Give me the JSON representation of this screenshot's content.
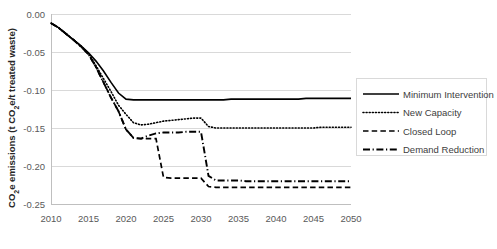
{
  "chart_data": {
    "type": "line",
    "title": "",
    "xlabel": "",
    "ylabel": "CO₂e emissions (t CO₂e/t treated waste)",
    "ylabel_parts": {
      "pre": "CO",
      "sub1": "2",
      "mid": "e emissions (t CO",
      "sub2": "2",
      "post": "e/t treated waste)"
    },
    "xlim": [
      2010,
      2050
    ],
    "ylim": [
      -0.25,
      0.0
    ],
    "grid": true,
    "legend_position": "right",
    "xticks": [
      "2010",
      "2015",
      "2020",
      "2025",
      "2030",
      "2035",
      "2040",
      "2045",
      "2050"
    ],
    "xtick_values": [
      2010,
      2015,
      2020,
      2025,
      2030,
      2035,
      2040,
      2045,
      2050
    ],
    "yticks": [
      "0.00",
      "-0.05",
      "-0.10",
      "-0.15",
      "-0.20",
      "-0.25"
    ],
    "ytick_values": [
      0.0,
      -0.05,
      -0.1,
      -0.15,
      -0.2,
      -0.25
    ],
    "x": [
      2010,
      2011,
      2012,
      2013,
      2014,
      2015,
      2016,
      2017,
      2018,
      2019,
      2020,
      2021,
      2022,
      2023,
      2024,
      2025,
      2026,
      2027,
      2028,
      2029,
      2030,
      2031,
      2032,
      2033,
      2034,
      2035,
      2036,
      2037,
      2038,
      2039,
      2040,
      2041,
      2042,
      2043,
      2044,
      2045,
      2046,
      2047,
      2048,
      2049,
      2050
    ],
    "series": [
      {
        "name": "Minimum Intervention",
        "style": "solid",
        "values": [
          -0.012,
          -0.018,
          -0.026,
          -0.034,
          -0.042,
          -0.051,
          -0.062,
          -0.075,
          -0.09,
          -0.104,
          -0.112,
          -0.113,
          -0.113,
          -0.113,
          -0.113,
          -0.113,
          -0.113,
          -0.113,
          -0.113,
          -0.113,
          -0.113,
          -0.113,
          -0.113,
          -0.113,
          -0.112,
          -0.112,
          -0.112,
          -0.112,
          -0.112,
          -0.112,
          -0.112,
          -0.112,
          -0.112,
          -0.112,
          -0.111,
          -0.111,
          -0.111,
          -0.111,
          -0.111,
          -0.111,
          -0.111
        ]
      },
      {
        "name": "New Capacity",
        "style": "dotted",
        "values": [
          -0.012,
          -0.018,
          -0.026,
          -0.034,
          -0.042,
          -0.052,
          -0.068,
          -0.085,
          -0.102,
          -0.12,
          -0.132,
          -0.143,
          -0.146,
          -0.145,
          -0.143,
          -0.141,
          -0.14,
          -0.139,
          -0.138,
          -0.137,
          -0.137,
          -0.148,
          -0.15,
          -0.15,
          -0.15,
          -0.15,
          -0.15,
          -0.15,
          -0.15,
          -0.15,
          -0.15,
          -0.15,
          -0.15,
          -0.15,
          -0.15,
          -0.15,
          -0.149,
          -0.149,
          -0.149,
          -0.149,
          -0.149
        ]
      },
      {
        "name": "Closed Loop",
        "style": "dashed",
        "values": [
          -0.012,
          -0.018,
          -0.026,
          -0.034,
          -0.043,
          -0.053,
          -0.07,
          -0.09,
          -0.11,
          -0.128,
          -0.152,
          -0.163,
          -0.164,
          -0.164,
          -0.164,
          -0.215,
          -0.216,
          -0.216,
          -0.216,
          -0.216,
          -0.216,
          -0.227,
          -0.228,
          -0.228,
          -0.228,
          -0.228,
          -0.228,
          -0.228,
          -0.228,
          -0.228,
          -0.228,
          -0.228,
          -0.228,
          -0.228,
          -0.228,
          -0.228,
          -0.228,
          -0.228,
          -0.228,
          -0.228,
          -0.228
        ]
      },
      {
        "name": "Demand Reduction",
        "style": "dashdot",
        "values": [
          -0.012,
          -0.018,
          -0.026,
          -0.034,
          -0.043,
          -0.053,
          -0.07,
          -0.09,
          -0.11,
          -0.128,
          -0.152,
          -0.163,
          -0.164,
          -0.16,
          -0.157,
          -0.156,
          -0.156,
          -0.156,
          -0.155,
          -0.155,
          -0.155,
          -0.213,
          -0.219,
          -0.219,
          -0.219,
          -0.219,
          -0.22,
          -0.22,
          -0.22,
          -0.22,
          -0.22,
          -0.22,
          -0.22,
          -0.22,
          -0.22,
          -0.22,
          -0.22,
          -0.22,
          -0.22,
          -0.22,
          -0.22
        ]
      }
    ],
    "legend": [
      {
        "label": "Minimum Intervention",
        "style": "solid"
      },
      {
        "label": "New Capacity",
        "style": "dotted"
      },
      {
        "label": "Closed Loop",
        "style": "dashed"
      },
      {
        "label": "Demand Reduction",
        "style": "dashdot"
      }
    ],
    "colors": {
      "series": "#000000",
      "grid": "#d9d9d9",
      "axis": "#bfbfbf",
      "text": "#404040",
      "background": "#ffffff"
    }
  }
}
